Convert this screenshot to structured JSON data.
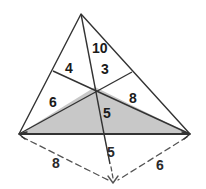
{
  "figure": {
    "background_color": "#ffffff",
    "stroke_color": "#333333",
    "shaded_fill_color": "#c8c8c8",
    "dashed_color": "#555555"
  },
  "vertices": {
    "apex": {
      "label": "apex",
      "x": 81,
      "y": 14
    },
    "bottom_left": {
      "label": "bottom-left",
      "x": 19,
      "y": 134
    },
    "bottom_right": {
      "label": "bottom-right",
      "x": 190,
      "y": 134
    },
    "interior_point": {
      "label": "cevian-intersection",
      "x": 95,
      "y": 87
    },
    "left_edge_point": {
      "label": "point-on-left-side",
      "x": 53,
      "y": 71
    },
    "right_edge_point": {
      "label": "point-on-right-side",
      "x": 132,
      "y": 72
    },
    "cevian_foot": {
      "label": "cevian-foot-on-base",
      "x": 104,
      "y": 134
    },
    "dashed_apex": {
      "label": "dashed-convergence",
      "x": 113,
      "y": 183
    }
  },
  "region_labels": [
    {
      "name": "area-10",
      "value": "10",
      "x": 92,
      "y": 41
    },
    {
      "name": "area-4",
      "value": "4",
      "x": 65,
      "y": 61
    },
    {
      "name": "area-3",
      "value": "3",
      "x": 101,
      "y": 62
    },
    {
      "name": "area-6",
      "value": "6",
      "x": 49,
      "y": 95
    },
    {
      "name": "area-8",
      "value": "8",
      "x": 129,
      "y": 91
    },
    {
      "name": "area-5",
      "value": "5",
      "x": 103,
      "y": 106
    }
  ],
  "dimension_labels": [
    {
      "name": "dim-5",
      "value": "5",
      "x": 107,
      "y": 145
    },
    {
      "name": "dim-8",
      "value": "8",
      "x": 52,
      "y": 156
    },
    {
      "name": "dim-6",
      "value": "6",
      "x": 156,
      "y": 158
    }
  ],
  "shaded_region": {
    "name": "shaded-triangle",
    "points": "19,134 190,134 95,87"
  }
}
